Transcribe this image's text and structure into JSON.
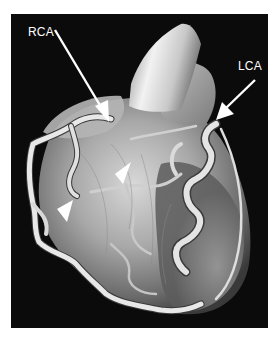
{
  "figure": {
    "colors": {
      "background": "#0b0b0b",
      "page": "#ffffff",
      "annotation": "#ffffff",
      "tissue_light": "#e6e6e6",
      "tissue_mid": "#9a9a9a",
      "tissue_dark": "#4a4a4a"
    },
    "annotations": [
      {
        "id": "rca",
        "label": "RCA",
        "meaning": "Right coronary artery",
        "pointer": "arrow"
      },
      {
        "id": "lca",
        "label": "LCA",
        "meaning": "Left coronary artery",
        "pointer": "arrow"
      }
    ],
    "arrowheads": [
      {
        "id": "arrowhead-upper",
        "pointer": "arrowhead"
      },
      {
        "id": "arrowhead-lower",
        "pointer": "arrowhead"
      }
    ]
  }
}
